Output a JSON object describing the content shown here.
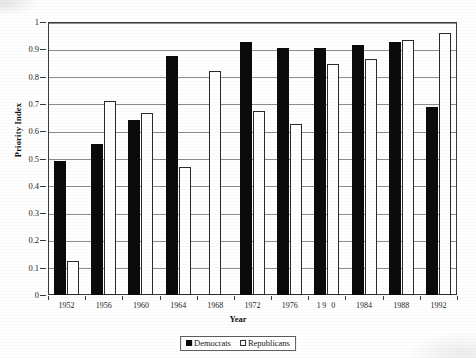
{
  "chart_data": {
    "type": "bar",
    "title": "Priority Index",
    "title_visible_fragment": "",
    "xlabel": "Year",
    "ylabel": "Priority Index",
    "ylim": [
      0,
      1
    ],
    "ytick_step": 0.1,
    "grid": true,
    "legend_position": "bottom-center",
    "categories": [
      "1952",
      "1956",
      "1960",
      "1964",
      "1968",
      "1972",
      "1976",
      "1980",
      "1984",
      "1988",
      "1992"
    ],
    "category_labels_as_rendered": [
      "1952",
      "1956",
      "1960",
      "1964",
      "1968",
      "1972",
      "1976",
      "19 0",
      "1984",
      "1988",
      "1992"
    ],
    "ytick_labels": [
      "0",
      "0.1",
      "0.2",
      "0.3",
      "0.4",
      "0.5",
      "0.6",
      "0.7",
      "0.8",
      "0.9",
      "1"
    ],
    "series": [
      {
        "name": "Democrats",
        "color": "#0b0b0b",
        "values": [
          0.49,
          0.555,
          0.64,
          0.875,
          0,
          0.925,
          0.905,
          0.905,
          0.915,
          0.925,
          0.69
        ]
      },
      {
        "name": "Republicans",
        "color": "#ffffff",
        "values": [
          0.125,
          0.71,
          0.665,
          0.47,
          0.82,
          0.675,
          0.625,
          0.845,
          0.865,
          0.935,
          0.96
        ]
      }
    ]
  },
  "legend": {
    "items": [
      {
        "label": "Democrats",
        "swatch": "filled-black-square"
      },
      {
        "label": "Republicans",
        "swatch": "outlined-white-square"
      }
    ]
  },
  "colors": {
    "democrat_fill": "#0b0b0b",
    "republican_fill": "#ffffff",
    "bar_outline": "#2b2b2b",
    "gridline": "#8d8d8d",
    "frame": "#3a3a3a",
    "background": "#ffffff"
  }
}
